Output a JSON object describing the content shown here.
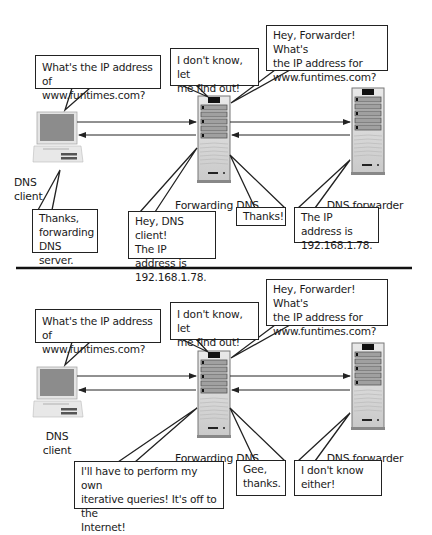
{
  "panels": [
    {
      "name": "successful-forwarding",
      "client_label": "DNS\nclient",
      "forwarding_label": "Forwarding DNS",
      "forwarder_label": "DNS forwarder",
      "bubbles": {
        "client_query": "What's the IP address of\nwww.funtimes.com?",
        "forwarding_find_out": "I don't know, let\nme find out!",
        "forwarding_to_forwarder": "Hey, Forwarder!  What's\nthe IP address for\nwww.funtimes.com?",
        "client_reply": "Thanks,\nforwarding\nDNS server.",
        "forwarding_answer": "Hey, DNS client!\nThe IP address is\n192.168.1.78.",
        "forwarding_thanks": "Thanks!",
        "forwarder_answer": "The IP address is\n192.168.1.78."
      }
    },
    {
      "name": "failed-forwarding",
      "client_label": "DNS\nclient",
      "forwarding_label": "Forwarding DNS",
      "forwarder_label": "DNS forwarder",
      "bubbles": {
        "client_query": "What's the IP address of\nwww.funtimes.com?",
        "forwarding_find_out": "I don't know, let\nme find out!",
        "forwarding_to_forwarder": "Hey, Forwarder!  What's\nthe IP address for\nwww.funtimes.com?",
        "forwarding_iterative": "I'll have to perform my own\niterative queries!  It's off to the\nInternet!",
        "forwarding_thanks": "Gee,\nthanks.",
        "forwarder_answer": "I don't know\neither!"
      }
    }
  ],
  "colors": {
    "outline": "#222222",
    "monitor_screen": "#8a8a8a",
    "server_body": "#d8d8d8",
    "server_drive": "#9a9a9a",
    "background": "#ffffff"
  }
}
